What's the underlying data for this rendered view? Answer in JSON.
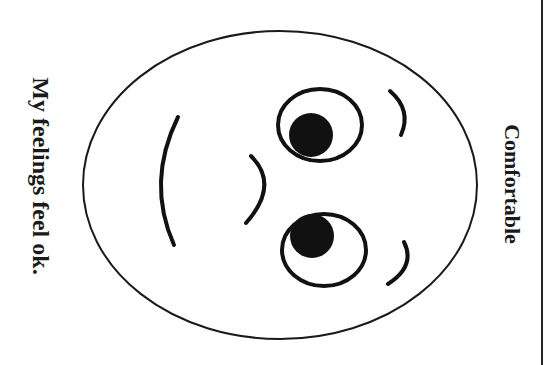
{
  "card": {
    "title": "Comfortable",
    "caption": "My feelings feel ok.",
    "stroke_color": "#1a1a1a",
    "background_color": "#ffffff"
  },
  "face": {
    "emotion": "comfortable",
    "parts": [
      "face-outline",
      "left-eye",
      "right-eye",
      "left-eyebrow",
      "right-eyebrow",
      "nose",
      "mouth"
    ]
  }
}
